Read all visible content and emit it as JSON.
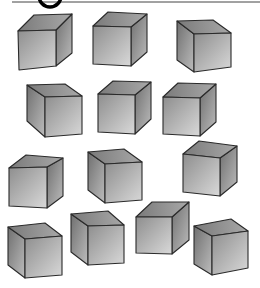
{
  "worksheet": {
    "header_frame": {
      "line_y": 2,
      "x_start": 12,
      "x_end": 260,
      "arc_cx": 50,
      "arc_r": 11
    },
    "colors": {
      "background": "#ffffff",
      "edge": "#2a2a2a",
      "front_light": "#d4d4d4",
      "front_dark": "#8e8e8e",
      "side_light": "#b0b0b0",
      "side_dark": "#6f6f6f",
      "top_light": "#a8a8a8",
      "top_dark": "#7a7a7a"
    },
    "cube_count": 13,
    "cubes": [
      {
        "id": 1,
        "orientation": "right",
        "front": [
          [
            18,
            31
          ],
          [
            56,
            30
          ],
          [
            56,
            66
          ],
          [
            19,
            70
          ]
        ],
        "back": [
          [
            34,
            15
          ],
          [
            72,
            14
          ],
          [
            72,
            53
          ]
        ]
      },
      {
        "id": 2,
        "orientation": "right",
        "front": [
          [
            93,
            26
          ],
          [
            131,
            27
          ],
          [
            131,
            66
          ],
          [
            93,
            64
          ]
        ],
        "back": [
          [
            108,
            12
          ],
          [
            147,
            14
          ],
          [
            147,
            52
          ]
        ]
      },
      {
        "id": 3,
        "orientation": "left",
        "front": [
          [
            194,
            34
          ],
          [
            231,
            33
          ],
          [
            231,
            67
          ],
          [
            194,
            72
          ]
        ],
        "back": [
          [
            177,
            21
          ],
          [
            213,
            20
          ],
          [
            177,
            60
          ]
        ]
      },
      {
        "id": 4,
        "orientation": "left",
        "front": [
          [
            45,
            97
          ],
          [
            82,
            96
          ],
          [
            82,
            134
          ],
          [
            45,
            137
          ]
        ],
        "back": [
          [
            27,
            85
          ],
          [
            65,
            84
          ],
          [
            27,
            121
          ]
        ]
      },
      {
        "id": 5,
        "orientation": "right",
        "front": [
          [
            98,
            94
          ],
          [
            135,
            95
          ],
          [
            135,
            134
          ],
          [
            98,
            132
          ]
        ],
        "back": [
          [
            113,
            81
          ],
          [
            151,
            82
          ],
          [
            151,
            119
          ]
        ]
      },
      {
        "id": 6,
        "orientation": "right",
        "front": [
          [
            163,
            97
          ],
          [
            200,
            98
          ],
          [
            200,
            136
          ],
          [
            163,
            134
          ]
        ],
        "back": [
          [
            178,
            83
          ],
          [
            216,
            84
          ],
          [
            216,
            122
          ]
        ]
      },
      {
        "id": 7,
        "orientation": "right",
        "front": [
          [
            9,
            168
          ],
          [
            47,
            167
          ],
          [
            47,
            208
          ],
          [
            9,
            206
          ]
        ],
        "back": [
          [
            26,
            155
          ],
          [
            63,
            158
          ],
          [
            63,
            196
          ]
        ]
      },
      {
        "id": 8,
        "orientation": "left",
        "front": [
          [
            105,
            164
          ],
          [
            142,
            162
          ],
          [
            142,
            200
          ],
          [
            105,
            203
          ]
        ],
        "back": [
          [
            88,
            152
          ],
          [
            124,
            149
          ],
          [
            88,
            190
          ]
        ]
      },
      {
        "id": 9,
        "orientation": "right",
        "front": [
          [
            183,
            154
          ],
          [
            220,
            158
          ],
          [
            220,
            196
          ],
          [
            183,
            192
          ]
        ],
        "back": [
          [
            199,
            141
          ],
          [
            237,
            146
          ],
          [
            237,
            182
          ]
        ]
      },
      {
        "id": 10,
        "orientation": "left",
        "front": [
          [
            25,
            239
          ],
          [
            62,
            236
          ],
          [
            62,
            275
          ],
          [
            25,
            278
          ]
        ],
        "back": [
          [
            8,
            227
          ],
          [
            45,
            223
          ],
          [
            8,
            265
          ]
        ]
      },
      {
        "id": 11,
        "orientation": "left",
        "front": [
          [
            88,
            226
          ],
          [
            124,
            225
          ],
          [
            124,
            263
          ],
          [
            88,
            265
          ]
        ],
        "back": [
          [
            71,
            214
          ],
          [
            108,
            211
          ],
          [
            71,
            252
          ]
        ]
      },
      {
        "id": 12,
        "orientation": "right",
        "front": [
          [
            136,
            217
          ],
          [
            172,
            217
          ],
          [
            172,
            254
          ],
          [
            136,
            253
          ]
        ],
        "back": [
          [
            152,
            202
          ],
          [
            189,
            202
          ],
          [
            189,
            240
          ]
        ]
      },
      {
        "id": 13,
        "orientation": "left",
        "front": [
          [
            212,
            236
          ],
          [
            248,
            231
          ],
          [
            248,
            268
          ],
          [
            212,
            275
          ]
        ],
        "back": [
          [
            194,
            226
          ],
          [
            231,
            219
          ],
          [
            194,
            264
          ]
        ]
      }
    ]
  }
}
